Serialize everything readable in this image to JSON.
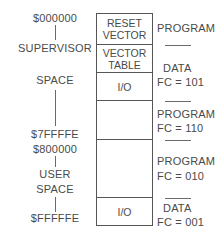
{
  "left_labels": {
    "start_address": "$000000",
    "supervisor_line1": "SUPERVISOR",
    "supervisor_line2": "SPACE",
    "supervisor_end": "$7FFFFE",
    "user_start": "$800000",
    "user_line1": "USER",
    "user_line2": "SPACE",
    "end_address": "$FFFFFE"
  },
  "memory_blocks": [
    {
      "line1": "RESET",
      "line2": "VECTOR"
    },
    {
      "line1": "VECTOR",
      "line2": "TABLE"
    },
    {
      "line1": "I/O",
      "line2": ""
    },
    {
      "line1": "",
      "line2": ""
    },
    {
      "line1": "",
      "line2": ""
    },
    {
      "line1": "I/O",
      "line2": ""
    }
  ],
  "right_labels": [
    {
      "type": "PROGRAM",
      "fc": ""
    },
    {
      "type": "DATA",
      "fc": "FC = 101"
    },
    {
      "type": "PROGRAM",
      "fc": "FC = 110"
    },
    {
      "type": "PROGRAM",
      "fc": "FC = 010"
    },
    {
      "type": "DATA",
      "fc": "FC = 001"
    }
  ]
}
